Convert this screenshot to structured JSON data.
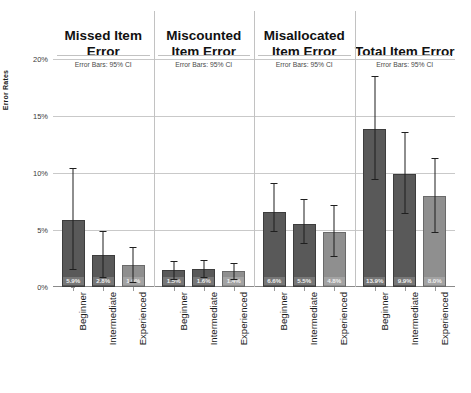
{
  "chart_data": {
    "type": "bar",
    "title": "",
    "xlabel": "",
    "ylabel": "Error Rates",
    "ylim": [
      0,
      20
    ],
    "ytick_labels": [
      "0%",
      "5%",
      "10%",
      "15%",
      "20%"
    ],
    "ytick_values": [
      0,
      5,
      10,
      15,
      20
    ],
    "grid": true,
    "legend": "none",
    "categories": [
      "Beginner",
      "Intermediate",
      "Experienced"
    ],
    "annotation": "Error Bars: 95% CI",
    "units": "percent",
    "panels": [
      {
        "title": "Missed Item Error",
        "note": "Error Bars: 95% CI",
        "values": [
          5.9,
          2.8,
          1.9
        ],
        "labels": [
          "5.9%",
          "2.8%",
          "1.9%"
        ],
        "ci_low": [
          1.6,
          0.9,
          0.4
        ],
        "ci_high": [
          10.4,
          4.9,
          3.5
        ]
      },
      {
        "title": "Miscounted Item Error",
        "note": "Error Bars: 95% CI",
        "values": [
          1.5,
          1.6,
          1.4
        ],
        "labels": [
          "1.5%",
          "1.6%",
          "1.4%"
        ],
        "ci_low": [
          0.7,
          0.9,
          0.7
        ],
        "ci_high": [
          2.3,
          2.4,
          2.1
        ]
      },
      {
        "title": "Misallocated Item Error",
        "note": "Error Bars: 95% CI",
        "values": [
          6.6,
          5.5,
          4.8
        ],
        "labels": [
          "6.6%",
          "5.5%",
          "4.8%"
        ],
        "ci_low": [
          4.9,
          3.9,
          2.7
        ],
        "ci_high": [
          9.1,
          7.7,
          7.2
        ]
      },
      {
        "title": "Total Item Error",
        "note": "Error Bars: 95% CI",
        "values": [
          13.9,
          9.9,
          8.0
        ],
        "labels": [
          "13.9%",
          "9.9%",
          "8.0%"
        ],
        "ci_low": [
          9.5,
          6.5,
          4.8
        ],
        "ci_high": [
          18.5,
          13.6,
          11.3
        ]
      }
    ],
    "colors": {
      "bar_dark": "#595959",
      "bar_light": "#8f8f8f",
      "gridline": "#c9c9c9",
      "error_bar": "#1f1f1f",
      "background": "#ffffff"
    }
  }
}
